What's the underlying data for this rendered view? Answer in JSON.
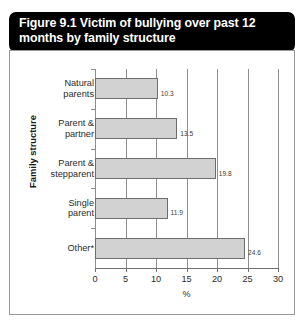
{
  "figure": {
    "title": "Figure 9.1 Victim of bullying over past 12 months by family structure"
  },
  "chart_data": {
    "type": "bar",
    "orientation": "horizontal",
    "title": "Figure 9.1 Victim of bullying over past 12 months by family structure",
    "categories": [
      "Natural parents",
      "Parent & partner",
      "Parent & stepparent",
      "Single parent",
      "Other*"
    ],
    "values": [
      10.3,
      13.5,
      19.8,
      11.9,
      24.6
    ],
    "value_labels": [
      "10.3",
      "13.5",
      "19.8",
      "11.9",
      "24.6"
    ],
    "xlabel": "%",
    "ylabel": "Family structure",
    "xlim": [
      0,
      30
    ],
    "xticks": [
      0,
      5,
      10,
      15,
      20,
      25,
      30
    ],
    "xtick_labels": [
      "0",
      "5",
      "10",
      "15",
      "20",
      "25",
      "30"
    ],
    "grid": true,
    "grid_axis": "x",
    "legend": false,
    "bar_color": "#d2d2d2",
    "bar_border_color": "#6d6d6d",
    "header_background": "#000000",
    "header_text_color": "#ffffff"
  },
  "category_lines": [
    [
      "Natural",
      "parents"
    ],
    [
      "Parent &",
      "partner"
    ],
    [
      "Parent &",
      "stepparent"
    ],
    [
      "Single",
      "parent"
    ],
    [
      "Other*"
    ]
  ]
}
